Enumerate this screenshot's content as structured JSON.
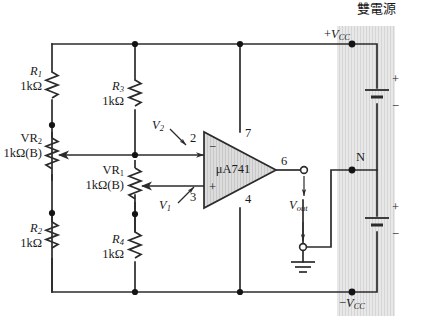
{
  "figure": {
    "kind": "circuit-schematic",
    "title_cn": "雙電源",
    "opamp": {
      "part": "μA741",
      "pin_inverting": "2",
      "pin_noninverting": "3",
      "pin_vplus": "7",
      "pin_vminus": "4",
      "pin_output": "6",
      "sign_inverting": "−",
      "sign_noninverting": "+"
    },
    "components": [
      {
        "id": "R1",
        "name": "R",
        "sub": "1",
        "value": "1kΩ",
        "kind": "resistor"
      },
      {
        "id": "R2",
        "name": "R",
        "sub": "2",
        "value": "1kΩ",
        "kind": "resistor"
      },
      {
        "id": "R3",
        "name": "R",
        "sub": "3",
        "value": "1kΩ",
        "kind": "resistor"
      },
      {
        "id": "R4",
        "name": "R",
        "sub": "4",
        "value": "1kΩ",
        "kind": "resistor"
      },
      {
        "id": "VR1",
        "name": "VR",
        "sub": "1",
        "value": "1kΩ(B)",
        "kind": "potentiometer"
      },
      {
        "id": "VR2",
        "name": "VR",
        "sub": "2",
        "value": "1kΩ(B)",
        "kind": "potentiometer"
      }
    ],
    "signals": [
      {
        "id": "V1",
        "name": "V",
        "sub": "1",
        "note": "non-inverting input voltage"
      },
      {
        "id": "V2",
        "name": "V",
        "sub": "2",
        "note": "inverting input voltage"
      },
      {
        "id": "Vout",
        "name": "V",
        "sub": "out",
        "note": "output voltage"
      }
    ],
    "supply": {
      "positive_rail": {
        "sign": "+",
        "name": "V",
        "sub": "CC"
      },
      "negative_rail": {
        "sign": "−",
        "name": "V",
        "sub": "CC"
      },
      "midpoint": "N",
      "batteries": [
        {
          "plus": "+",
          "minus": "−"
        },
        {
          "plus": "+",
          "minus": "−"
        }
      ]
    },
    "ground_symbol": "earth-ground",
    "colors": {
      "wire": "#2b2b2b",
      "supply_box_fill": "#e4e4e4",
      "opamp_fill": "#d8d8d8",
      "text": "#1a1a1a",
      "page_bg": "#ffffff"
    }
  }
}
